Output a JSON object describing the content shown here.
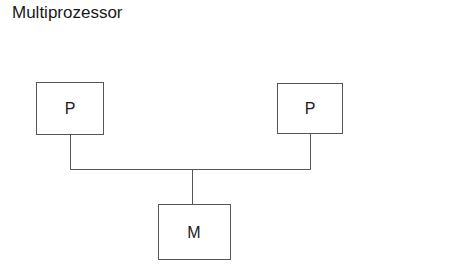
{
  "title": "Multiprozessor",
  "nodes": [
    {
      "id": "p1",
      "label": "P",
      "kind": "processor"
    },
    {
      "id": "p2",
      "label": "P",
      "kind": "processor"
    },
    {
      "id": "m",
      "label": "M",
      "kind": "memory"
    }
  ],
  "edges": [
    {
      "from": "p1",
      "to": "bus"
    },
    {
      "from": "p2",
      "to": "bus"
    },
    {
      "from": "bus",
      "to": "m"
    }
  ],
  "colors": {
    "stroke": "#555555",
    "text": "#1a1a1a",
    "background": "#ffffff"
  }
}
